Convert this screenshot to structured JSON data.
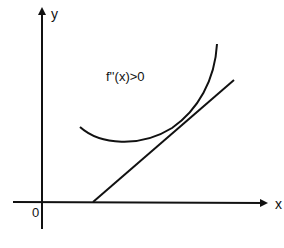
{
  "diagram": {
    "type": "convex-function-tangent",
    "axes": {
      "x_label": "x",
      "y_label": "y",
      "origin_label": "0"
    },
    "annotation": "f''(x)>0",
    "elements": [
      {
        "name": "convex-curve",
        "description": "upward-opening curve lying above its tangent line"
      },
      {
        "name": "tangent-line",
        "description": "straight line tangent to the curve, crossing the x-axis"
      }
    ],
    "colors": {
      "stroke": "#111111",
      "background": "#ffffff"
    }
  }
}
